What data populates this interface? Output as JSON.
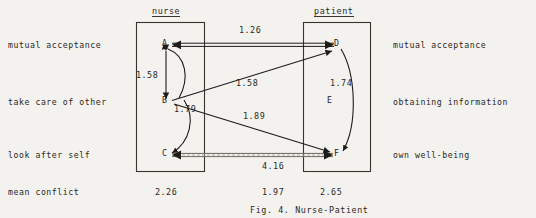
{
  "figure": {
    "caption": "Fig. 4.  Nurse-Patient",
    "groups": [
      {
        "id": "nurse",
        "title": "nurse"
      },
      {
        "id": "patient",
        "title": "patient"
      }
    ],
    "left_labels": [
      "mutual acceptance",
      "take care of other",
      "look after self"
    ],
    "right_labels": [
      "mutual acceptance",
      "obtaining information",
      "own well-being"
    ],
    "row_label_bottom": "mean conflict",
    "nodes": [
      {
        "id": "A",
        "label": "A",
        "group": "nurse"
      },
      {
        "id": "B",
        "label": "B",
        "group": "nurse"
      },
      {
        "id": "C",
        "label": "C",
        "group": "nurse"
      },
      {
        "id": "D",
        "label": "D",
        "group": "patient"
      },
      {
        "id": "E",
        "label": "E",
        "group": "patient"
      },
      {
        "id": "F",
        "label": "F",
        "group": "patient"
      }
    ],
    "edge_values": [
      {
        "id": "AD",
        "value": "1.26",
        "from": "A",
        "to": "D"
      },
      {
        "id": "AB",
        "value": "1.58",
        "from": "A",
        "to": "B"
      },
      {
        "id": "BD",
        "value": "1.58",
        "from": "B",
        "to": "D"
      },
      {
        "id": "DF",
        "value": "1.74",
        "from": "D",
        "to": "F"
      },
      {
        "id": "BC",
        "value": "1.79",
        "from": "B",
        "to": "C"
      },
      {
        "id": "BF",
        "value": "1.89",
        "from": "B",
        "to": "F"
      },
      {
        "id": "CF",
        "value": "4.16",
        "from": "C",
        "to": "F"
      }
    ],
    "mean_conflict": [
      {
        "id": "nurse",
        "value": "2.26"
      },
      {
        "id": "between",
        "value": "1.97"
      },
      {
        "id": "patient",
        "value": "2.65"
      }
    ]
  }
}
